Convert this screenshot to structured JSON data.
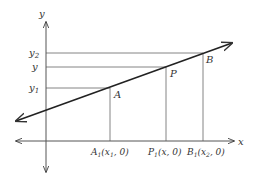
{
  "diagram": {
    "axes": {
      "x_label": "x",
      "y_label": "y"
    },
    "y_ticks": [
      {
        "label": "y",
        "sub": "2",
        "y": 53
      },
      {
        "label": "y",
        "sub": "",
        "y": 67
      },
      {
        "label": "y",
        "sub": "1",
        "y": 88
      }
    ],
    "points": [
      {
        "name": "A",
        "x": 110,
        "y": 88
      },
      {
        "name": "P",
        "x": 166,
        "y": 67
      },
      {
        "name": "B",
        "x": 203,
        "y": 53
      }
    ],
    "x_ticks": [
      {
        "label": "A",
        "sub": "1",
        "coords": "(x",
        "csub": "1",
        "tail": ", 0)",
        "x": 110
      },
      {
        "label": "P",
        "sub": "1",
        "coords": "(x, 0)",
        "csub": "",
        "tail": "",
        "x": 166
      },
      {
        "label": "B",
        "sub": "1",
        "coords": "(x",
        "csub": "2",
        "tail": ", 0)",
        "x": 203
      }
    ],
    "colors": {
      "line": "#333333",
      "guide": "#777777"
    }
  }
}
